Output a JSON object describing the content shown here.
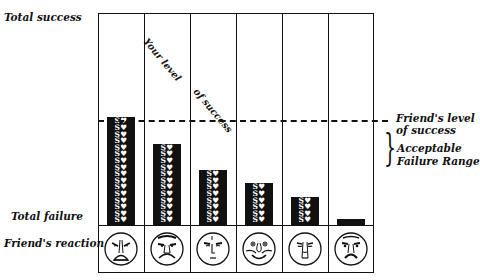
{
  "chart_data": {
    "type": "bar",
    "title": "",
    "xlabel": "",
    "ylabel": "",
    "y_axis_labels": {
      "top": "Total success",
      "bottom": "Total failure"
    },
    "row_label": "Friend's reaction",
    "categories": [
      "1",
      "2",
      "3",
      "4",
      "5",
      "6"
    ],
    "values": [
      16,
      12,
      8,
      6,
      4,
      0.5
    ],
    "unit": "rows of $♥ icons",
    "ylim": [
      0,
      17
    ],
    "reference_line": {
      "label": "Friend's level of success",
      "value": 8,
      "style": "dashed"
    },
    "range_annotation": {
      "label": "Acceptable Failure Range",
      "from": 8,
      "to": 4
    },
    "series_annotation": "Your level of success",
    "friend_reactions": [
      "furious",
      "angry-frown",
      "neutral-displeased",
      "happy-smiling",
      "worried-sad",
      "stern-displeased"
    ],
    "grid": false,
    "legend": "none"
  },
  "labels": {
    "total_success": "Total success",
    "total_failure": "Total failure",
    "friends_reaction": "Friend's reaction",
    "your_level_1": "Your level",
    "your_level_2": "of success",
    "friends_level_1": "Friend's level",
    "friends_level_2": "of success",
    "acceptable_1": "Acceptable",
    "acceptable_2": "Failure Range",
    "brace": "}"
  },
  "icon_row": "S♥"
}
